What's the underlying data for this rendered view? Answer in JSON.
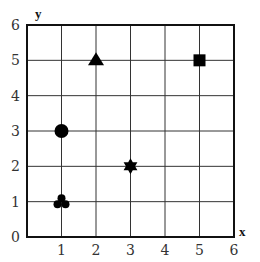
{
  "chart_data": {
    "type": "scatter",
    "title": "",
    "xlabel": "x",
    "ylabel": "y",
    "xlim": [
      0,
      6
    ],
    "ylim": [
      0,
      6
    ],
    "grid": true,
    "legend": null,
    "x_ticks": [
      "1",
      "2",
      "3",
      "4",
      "5",
      "6"
    ],
    "y_ticks": [
      "0",
      "1",
      "2",
      "3",
      "4",
      "5",
      "6"
    ],
    "points": [
      {
        "x": 1,
        "y": 1,
        "marker": "club"
      },
      {
        "x": 1,
        "y": 3,
        "marker": "circle"
      },
      {
        "x": 2,
        "y": 5,
        "marker": "triangle"
      },
      {
        "x": 3,
        "y": 2,
        "marker": "star6"
      },
      {
        "x": 5,
        "y": 5,
        "marker": "square"
      }
    ],
    "colors": {
      "marker": "#000000",
      "grid": "#333333",
      "axis": "#111111"
    }
  }
}
